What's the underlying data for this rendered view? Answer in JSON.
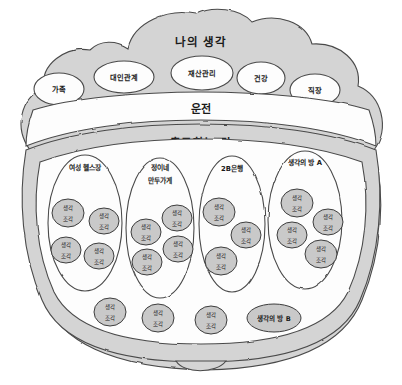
{
  "diagram": {
    "title": "나의 생각",
    "bands": {
      "driving": "운전",
      "commute": "출근하는 길"
    },
    "topics": [
      {
        "label": "가족",
        "cx": 59,
        "cy": 89,
        "rx": 25,
        "ry": 16
      },
      {
        "label": "대인관계",
        "cx": 124,
        "cy": 77,
        "rx": 30,
        "ry": 16
      },
      {
        "label": "재산관리",
        "cx": 202,
        "cy": 73,
        "rx": 31,
        "ry": 17
      },
      {
        "label": "건강",
        "cx": 261,
        "cy": 78,
        "rx": 24,
        "ry": 16
      },
      {
        "label": "직장",
        "cx": 315,
        "cy": 90,
        "rx": 25,
        "ry": 16
      }
    ],
    "pods": [
      {
        "label": "여성 헬스장",
        "label_lines": [
          "여성 헬스장"
        ],
        "cx": 85,
        "cy": 223,
        "rx": 37,
        "ry": 68,
        "label_y": 168,
        "fragments": [
          {
            "cx": 68,
            "cy": 213,
            "rx": 16,
            "ry": 14
          },
          {
            "cx": 104,
            "cy": 221,
            "rx": 15,
            "ry": 13
          },
          {
            "cx": 66,
            "cy": 250,
            "rx": 15,
            "ry": 13
          },
          {
            "cx": 99,
            "cy": 256,
            "rx": 15,
            "ry": 13
          }
        ]
      },
      {
        "label": "정이네 만두가게",
        "label_lines": [
          "정이네",
          "만두가게"
        ],
        "cx": 160,
        "cy": 228,
        "rx": 34,
        "ry": 70,
        "label_y": 168,
        "fragments": [
          {
            "cx": 146,
            "cy": 232,
            "rx": 15,
            "ry": 13
          },
          {
            "cx": 177,
            "cy": 218,
            "rx": 15,
            "ry": 13
          },
          {
            "cx": 178,
            "cy": 249,
            "rx": 15,
            "ry": 13
          },
          {
            "cx": 147,
            "cy": 262,
            "rx": 15,
            "ry": 13
          }
        ]
      },
      {
        "label": "2B은행",
        "label_lines": [
          "2B은행"
        ],
        "cx": 232,
        "cy": 224,
        "rx": 33,
        "ry": 68,
        "label_y": 169,
        "fragments": [
          {
            "cx": 219,
            "cy": 212,
            "rx": 16,
            "ry": 14
          },
          {
            "cx": 246,
            "cy": 235,
            "rx": 15,
            "ry": 13
          },
          {
            "cx": 221,
            "cy": 261,
            "rx": 16,
            "ry": 14
          }
        ]
      },
      {
        "label": "생각의 방 A",
        "label_lines": [
          "생각의 방 A"
        ],
        "cx": 305,
        "cy": 220,
        "rx": 37,
        "ry": 69,
        "label_y": 163,
        "fragments": [
          {
            "cx": 297,
            "cy": 203,
            "rx": 16,
            "ry": 14
          },
          {
            "cx": 328,
            "cy": 222,
            "rx": 15,
            "ry": 13
          },
          {
            "cx": 292,
            "cy": 235,
            "rx": 15,
            "ry": 13
          },
          {
            "cx": 321,
            "cy": 254,
            "rx": 16,
            "ry": 14
          }
        ]
      }
    ],
    "bottom_fragments": [
      {
        "label": "생각 조각",
        "cx": 110,
        "cy": 312,
        "rx": 16,
        "ry": 14,
        "kind": "fragment"
      },
      {
        "label": "생각 조각",
        "cx": 158,
        "cy": 318,
        "rx": 16,
        "ry": 14,
        "kind": "fragment"
      },
      {
        "label": "생각 조각",
        "cx": 211,
        "cy": 320,
        "rx": 16,
        "ry": 14,
        "kind": "fragment"
      },
      {
        "label": "생각의 방 B",
        "cx": 274,
        "cy": 318,
        "rx": 27,
        "ry": 14,
        "kind": "room"
      }
    ],
    "fragment_label": "생각 조각",
    "fragment_label_lines": [
      "생각",
      "조각"
    ],
    "colors": {
      "gray_fill": "#d4d4d4",
      "white_fill": "#fdfdfd",
      "fragment_fill": "#c9c9c9",
      "outline": "#4a4a4a",
      "text": "#1a1a1a",
      "background": "#ffffff"
    }
  }
}
